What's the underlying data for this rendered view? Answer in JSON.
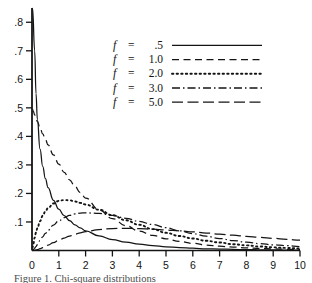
{
  "figure": {
    "caption": "Figure 1. Chi-square distributions"
  },
  "axes": {
    "x_ticks": [
      "0",
      "1",
      "2",
      "3",
      "4",
      "5",
      "6",
      "7",
      "8",
      "9",
      "10"
    ],
    "y_ticks": [
      ".1",
      ".2",
      ".3",
      ".4",
      ".5",
      ".6",
      ".7",
      ".8"
    ],
    "xlabel": "",
    "ylabel": ""
  },
  "legend": {
    "var_symbol": "f",
    "equals": "=",
    "entries": [
      {
        "var": "f",
        "eq": "=",
        "value": ".5",
        "style": "solid"
      },
      {
        "var": "f",
        "eq": "=",
        "value": "1.0",
        "style": "dashed"
      },
      {
        "var": "f",
        "eq": "=",
        "value": "2.0",
        "style": "dotted"
      },
      {
        "var": "f",
        "eq": "=",
        "value": "3.0",
        "style": "dashdot"
      },
      {
        "var": "f",
        "eq": "=",
        "value": "5.0",
        "style": "longdash"
      }
    ]
  },
  "colors": {
    "ink": "#141414",
    "background": "#ffffff"
  },
  "chart_data": {
    "type": "line",
    "title": "",
    "xlabel": "",
    "ylabel": "",
    "xlim": [
      0,
      10
    ],
    "ylim": [
      0,
      0.85
    ],
    "grid": false,
    "legend_position": "upper-center",
    "x": [
      0.02,
      0.05,
      0.1,
      0.15,
      0.2,
      0.3,
      0.4,
      0.5,
      0.6,
      0.8,
      1.0,
      1.2,
      1.4,
      1.6,
      1.8,
      2.0,
      2.5,
      3.0,
      3.5,
      4.0,
      4.5,
      5.0,
      5.5,
      6.0,
      6.5,
      7.0,
      7.5,
      8.0,
      8.5,
      9.0,
      9.5,
      10.0
    ],
    "series": [
      {
        "name": "f = .5",
        "style": "solid",
        "values": [
          1.72,
          1.05,
          0.7,
          0.55,
          0.46,
          0.355,
          0.295,
          0.252,
          0.22,
          0.176,
          0.145,
          0.122,
          0.105,
          0.09,
          0.079,
          0.069,
          0.051,
          0.038,
          0.029,
          0.022,
          0.017,
          0.013,
          0.01,
          0.008,
          0.006,
          0.005,
          0.004,
          0.003,
          0.0025,
          0.002,
          0.0015,
          0.0012
        ]
      },
      {
        "name": "f = 1.0",
        "style": "dashed",
        "values": [
          0.495,
          0.488,
          0.475,
          0.464,
          0.452,
          0.43,
          0.409,
          0.389,
          0.37,
          0.335,
          0.303,
          0.274,
          0.248,
          0.225,
          0.203,
          0.184,
          0.143,
          0.112,
          0.087,
          0.068,
          0.053,
          0.041,
          0.032,
          0.025,
          0.019,
          0.015,
          0.012,
          0.009,
          0.007,
          0.0055,
          0.0043,
          0.0034
        ]
      },
      {
        "name": "f = 2.0",
        "style": "dotted",
        "values": [
          0.01,
          0.024,
          0.045,
          0.063,
          0.078,
          0.103,
          0.122,
          0.137,
          0.149,
          0.165,
          0.174,
          0.177,
          0.176,
          0.172,
          0.167,
          0.161,
          0.143,
          0.124,
          0.106,
          0.09,
          0.075,
          0.062,
          0.051,
          0.042,
          0.034,
          0.028,
          0.022,
          0.018,
          0.014,
          0.011,
          0.009,
          0.007
        ]
      },
      {
        "name": "f = 3.0",
        "style": "dashdot",
        "values": [
          0.0005,
          0.003,
          0.008,
          0.014,
          0.021,
          0.035,
          0.048,
          0.06,
          0.071,
          0.089,
          0.104,
          0.115,
          0.123,
          0.128,
          0.131,
          0.132,
          0.13,
          0.123,
          0.113,
          0.102,
          0.091,
          0.08,
          0.069,
          0.059,
          0.05,
          0.042,
          0.035,
          0.029,
          0.024,
          0.02,
          0.017,
          0.014
        ]
      },
      {
        "name": "f = 5.0",
        "style": "longdash",
        "values": [
          1e-05,
          0.0002,
          0.0008,
          0.0018,
          0.003,
          0.0063,
          0.0102,
          0.0144,
          0.0188,
          0.0275,
          0.0359,
          0.0437,
          0.0507,
          0.0568,
          0.062,
          0.0663,
          0.0735,
          0.077,
          0.0779,
          0.077,
          0.0749,
          0.072,
          0.0687,
          0.0651,
          0.0613,
          0.0574,
          0.0535,
          0.0497,
          0.046,
          0.0425,
          0.0391,
          0.036
        ]
      }
    ]
  }
}
